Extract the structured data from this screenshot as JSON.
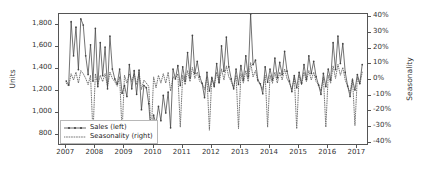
{
  "chart_data": {
    "type": "line",
    "title": "",
    "xlabel": "",
    "ylabel": "Units",
    "y2label": "Seasonality",
    "grid": false,
    "legend_position": "lower left",
    "xlim": [
      2006.75,
      2017.4
    ],
    "ylim": [
      700,
      1900
    ],
    "y2lim": [
      -0.42,
      0.42
    ],
    "yticks": [
      "800",
      "1,000",
      "1,200",
      "1,400",
      "1,600",
      "1,800"
    ],
    "ytick_values": [
      800,
      1000,
      1200,
      1400,
      1600,
      1800
    ],
    "y2ticks": [
      "-40%",
      "-30%",
      "-20%",
      "-10%",
      "0%",
      "10%",
      "20%",
      "30%",
      "40%"
    ],
    "y2tick_values": [
      -40,
      -30,
      -20,
      -10,
      0,
      10,
      20,
      30,
      40
    ],
    "xticks": [
      "2007",
      "2008",
      "2009",
      "2010",
      "2011",
      "2012",
      "2013",
      "2014",
      "2015",
      "2016",
      "2017"
    ],
    "xtick_values": [
      2007,
      2008,
      2009,
      2010,
      2011,
      2012,
      2013,
      2014,
      2015,
      2016,
      2017
    ],
    "series": [
      {
        "name": "Sales (left)",
        "axis": "left",
        "style": "solid-with-markers",
        "color": "#444444",
        "x": [
          2007.0,
          2007.083,
          2007.167,
          2007.25,
          2007.333,
          2007.417,
          2007.5,
          2007.583,
          2007.667,
          2007.75,
          2007.833,
          2007.917,
          2008.0,
          2008.083,
          2008.167,
          2008.25,
          2008.333,
          2008.417,
          2008.5,
          2008.583,
          2008.667,
          2008.75,
          2008.833,
          2008.917,
          2009.0,
          2009.083,
          2009.167,
          2009.25,
          2009.333,
          2009.417,
          2009.5,
          2009.583,
          2009.667,
          2009.75,
          2009.833,
          2009.917,
          2010.0,
          2010.083,
          2010.167,
          2010.25,
          2010.333,
          2010.417,
          2010.5,
          2010.583,
          2010.667,
          2010.75,
          2010.833,
          2010.917,
          2011.0,
          2011.083,
          2011.167,
          2011.25,
          2011.333,
          2011.417,
          2011.5,
          2011.583,
          2011.667,
          2011.75,
          2011.833,
          2011.917,
          2012.0,
          2012.083,
          2012.167,
          2012.25,
          2012.333,
          2012.417,
          2012.5,
          2012.583,
          2012.667,
          2012.75,
          2012.833,
          2012.917,
          2013.0,
          2013.083,
          2013.167,
          2013.25,
          2013.333,
          2013.417,
          2013.5,
          2013.583,
          2013.667,
          2013.75,
          2013.833,
          2013.917,
          2014.0,
          2014.083,
          2014.167,
          2014.25,
          2014.333,
          2014.417,
          2014.5,
          2014.583,
          2014.667,
          2014.75,
          2014.833,
          2014.917,
          2015.0,
          2015.083,
          2015.167,
          2015.25,
          2015.333,
          2015.417,
          2015.5,
          2015.583,
          2015.667,
          2015.75,
          2015.833,
          2015.917,
          2016.0,
          2016.083,
          2016.167,
          2016.25,
          2016.333,
          2016.417,
          2016.5,
          2016.583,
          2016.667,
          2016.75,
          2016.833,
          2016.917,
          2017.0,
          2017.083,
          2017.167
        ],
        "values": [
          1290,
          1255,
          1830,
          1520,
          1780,
          1395,
          1855,
          1800,
          1520,
          1350,
          1620,
          1290,
          1770,
          1240,
          1640,
          1340,
          1600,
          1220,
          1700,
          1400,
          1310,
          1265,
          1400,
          1180,
          1250,
          1150,
          1440,
          1220,
          1385,
          1170,
          1390,
          1030,
          1250,
          1230,
          1085,
          790,
          980,
          900,
          1060,
          930,
          1160,
          1000,
          1190,
          865,
          1400,
          1310,
          1430,
          1250,
          1420,
          1290,
          1550,
          1320,
          1705,
          1360,
          1470,
          1330,
          1270,
          1140,
          1370,
          1200,
          1320,
          1240,
          1450,
          1275,
          1610,
          1380,
          1690,
          1420,
          1310,
          1220,
          1400,
          1260,
          1430,
          1300,
          1520,
          1330,
          1900,
          1440,
          1480,
          1300,
          1265,
          1175,
          1420,
          1280,
          1400,
          1300,
          1500,
          1320,
          1460,
          1350,
          1560,
          1380,
          1290,
          1195,
          1340,
          1230,
          1370,
          1270,
          1440,
          1305,
          1520,
          1360,
          1470,
          1330,
          1255,
          1170,
          1360,
          1240,
          1400,
          1300,
          1640,
          1395,
          1700,
          1450,
          1630,
          1370,
          1245,
          1150,
          1300,
          1210,
          1350,
          1270,
          1440
        ]
      },
      {
        "name": "Seasonality (right)",
        "axis": "right",
        "style": "dotted",
        "color": "#666666",
        "x": [
          2007.0,
          2007.083,
          2007.167,
          2007.25,
          2007.333,
          2007.417,
          2007.5,
          2007.583,
          2007.667,
          2007.75,
          2007.833,
          2007.917,
          2008.0,
          2008.083,
          2008.167,
          2008.25,
          2008.333,
          2008.417,
          2008.5,
          2008.583,
          2008.667,
          2008.75,
          2008.833,
          2008.917,
          2009.0,
          2009.083,
          2009.167,
          2009.25,
          2009.333,
          2009.417,
          2009.5,
          2009.583,
          2009.667,
          2009.75,
          2009.833,
          2009.917,
          2010.0,
          2010.083,
          2010.167,
          2010.25,
          2010.333,
          2010.417,
          2010.5,
          2010.583,
          2010.667,
          2010.75,
          2010.833,
          2010.917,
          2011.0,
          2011.083,
          2011.167,
          2011.25,
          2011.333,
          2011.417,
          2011.5,
          2011.583,
          2011.667,
          2011.75,
          2011.833,
          2011.917,
          2012.0,
          2012.083,
          2012.167,
          2012.25,
          2012.333,
          2012.417,
          2012.5,
          2012.583,
          2012.667,
          2012.75,
          2012.833,
          2012.917,
          2013.0,
          2013.083,
          2013.167,
          2013.25,
          2013.333,
          2013.417,
          2013.5,
          2013.583,
          2013.667,
          2013.75,
          2013.833,
          2013.917,
          2014.0,
          2014.083,
          2014.167,
          2014.25,
          2014.333,
          2014.417,
          2014.5,
          2014.583,
          2014.667,
          2014.75,
          2014.833,
          2014.917,
          2015.0,
          2015.083,
          2015.167,
          2015.25,
          2015.333,
          2015.417,
          2015.5,
          2015.583,
          2015.667,
          2015.75,
          2015.833,
          2015.917,
          2016.0,
          2016.083,
          2016.167,
          2016.25,
          2016.333,
          2016.417,
          2016.5,
          2016.583,
          2016.667,
          2016.75,
          2016.833,
          2016.917,
          2017.0,
          2017.083,
          2017.167
        ],
        "values": [
          -2,
          -4,
          4,
          0,
          5,
          -2,
          6,
          4,
          1,
          -3,
          3,
          -34,
          4,
          -3,
          3,
          -1,
          4,
          -4,
          5,
          1,
          -1,
          -4,
          2,
          -33,
          3,
          -2,
          4,
          -1,
          4,
          -3,
          5,
          -6,
          0,
          -2,
          -4,
          -35,
          2,
          -5,
          3,
          -2,
          4,
          -2,
          5,
          -7,
          2,
          1,
          4,
          -30,
          3,
          -3,
          6,
          -1,
          8,
          1,
          5,
          -1,
          -2,
          -6,
          2,
          -32,
          2,
          -4,
          5,
          -2,
          7,
          0,
          9,
          2,
          -1,
          -5,
          3,
          -31,
          4,
          -2,
          6,
          -1,
          11,
          2,
          6,
          -1,
          -3,
          -6,
          3,
          -30,
          3,
          -2,
          5,
          -2,
          5,
          0,
          7,
          1,
          -2,
          -6,
          2,
          -31,
          3,
          -3,
          5,
          -1,
          6,
          0,
          5,
          -1,
          -3,
          -7,
          2,
          -30,
          3,
          -2,
          9,
          1,
          10,
          3,
          8,
          0,
          -4,
          -8,
          1,
          -29,
          2,
          -3,
          5
        ]
      }
    ]
  },
  "legend": {
    "items": [
      {
        "label": "Sales (left)",
        "style": "solid-with-markers"
      },
      {
        "label": "Seasonality (right)",
        "style": "dotted"
      }
    ]
  },
  "axes": {
    "left_label": "Units",
    "right_label": "Seasonality"
  },
  "colors": {
    "line": "#444444",
    "dotted": "#666666",
    "frame": "#555555",
    "text": "#333333",
    "background": "#ffffff"
  }
}
